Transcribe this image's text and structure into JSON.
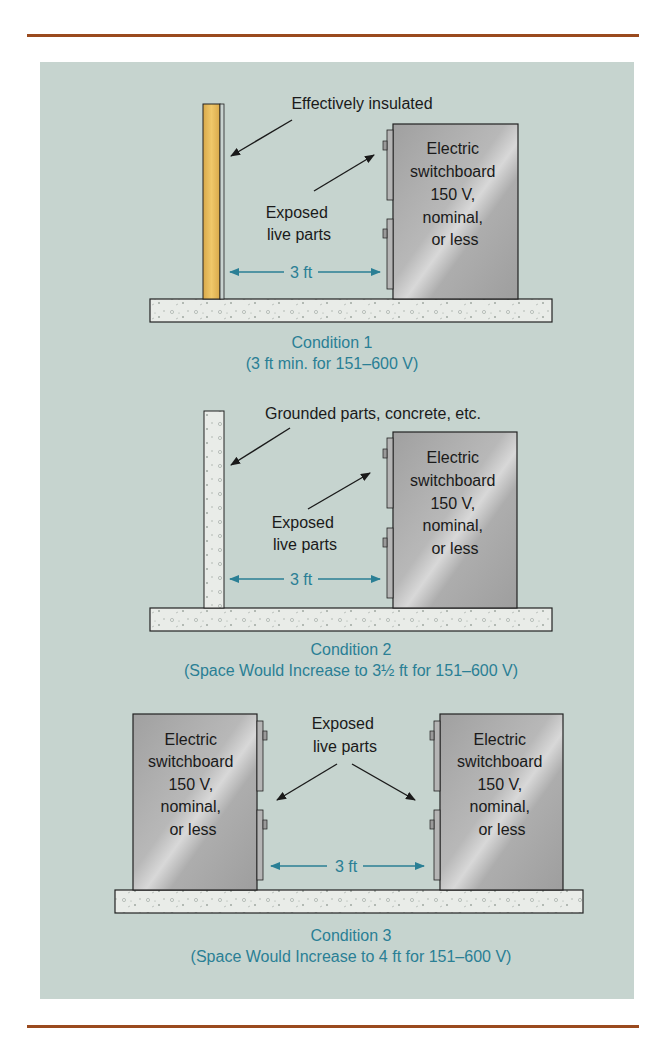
{
  "figure": {
    "conditions": [
      {
        "id": 1,
        "title": "Condition 1",
        "subtitle": "(3 ft min. for 151–600 V)",
        "wall_label": "Effectively insulated",
        "parts_label": [
          "Exposed",
          "live parts"
        ],
        "distance": "3 ft",
        "board_label": [
          "Electric",
          "switchboard",
          "150 V,",
          "nominal,",
          "or less"
        ]
      },
      {
        "id": 2,
        "title": "Condition 2",
        "subtitle": "(Space Would Increase to 3½ ft for 151–600 V)",
        "wall_label": "Grounded parts, concrete, etc.",
        "parts_label": [
          "Exposed",
          "live parts"
        ],
        "distance": "3 ft",
        "board_label": [
          "Electric",
          "switchboard",
          "150 V,",
          "nominal,",
          "or less"
        ]
      },
      {
        "id": 3,
        "title": "Condition 3",
        "subtitle": "(Space Would Increase to 4 ft for 151–600 V)",
        "parts_label": [
          "Exposed",
          "live parts"
        ],
        "distance": "3 ft",
        "board_label": [
          "Electric",
          "switchboard",
          "150 V,",
          "nominal,",
          "or less"
        ]
      }
    ],
    "colors": {
      "panel": "#c6d4cf",
      "rule": "#9a4a1e",
      "caption": "#2a7f95",
      "board": "#a9a9a9",
      "wood": "#e7bd5c",
      "concrete": "#e7ebe6"
    }
  }
}
